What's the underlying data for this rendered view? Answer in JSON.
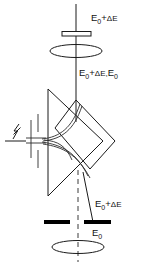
{
  "figure": {
    "background_color": "#ffffff",
    "line_color": "#1a1a1a",
    "fill_color": "#000000",
    "width": 150,
    "height": 264
  },
  "labels": {
    "top_beam": {
      "full": "E₀+ΔE",
      "base": "E",
      "subscript": "0",
      "plus": "+",
      "delta": "ΔE"
    },
    "mixed_beam": {
      "full": "E₀+ΔE,E₀",
      "base": "E",
      "subscript": "0",
      "plus": "+",
      "delta": "ΔE,",
      "base2": "E",
      "subscript2": "0"
    },
    "lower_deflected": {
      "full": "E₀+ΔE",
      "base": "E",
      "subscript": "0",
      "plus": "+",
      "delta": "ΔE"
    },
    "lower_direct": {
      "full": "E₀",
      "base": "E",
      "subscript": "0"
    }
  },
  "components": {
    "source": "lightning-bolt-symbol",
    "source_slit": "slit-aperture",
    "top_aperture": "hollow-aperture-bar",
    "top_lens": "lens-ellipse",
    "prism": "triangular-prism",
    "sector": "diamond-sector",
    "detector_slit_left": "filled-bar-left",
    "detector_slit_right": "filled-bar-right",
    "bottom_lens": "lens-ellipse",
    "optic_axis": "vertical-axis-line",
    "dashed_axis": "dashed-optic-axis",
    "beam_envelope": "crossover-beam-curves"
  }
}
